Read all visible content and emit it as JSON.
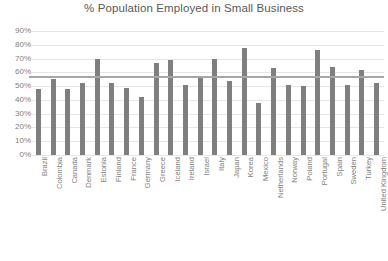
{
  "chart_data": {
    "type": "bar",
    "title": "% Population Employed in Small Business",
    "xlabel": "",
    "ylabel": "",
    "ylim": [
      0,
      90
    ],
    "ytick_labels": [
      "90%",
      "80%",
      "70%",
      "60%",
      "50%",
      "40%",
      "30%",
      "20%",
      "10%",
      "0%"
    ],
    "ytick_values": [
      90,
      80,
      70,
      60,
      50,
      40,
      30,
      20,
      10,
      0
    ],
    "grid": true,
    "legend": "none",
    "categories": [
      "Brazil",
      "Colombia",
      "Canada",
      "Denmark",
      "Estonia",
      "Finland",
      "France",
      "Germany",
      "Greece",
      "Iceland",
      "Ireland",
      "Israel",
      "Italy",
      "Japan",
      "Korea",
      "Mexico",
      "Netherlands",
      "Norway",
      "Poland",
      "Portugal",
      "Spain",
      "Sweden",
      "Turkey",
      "United Kingdom"
    ],
    "values": [
      48,
      55,
      48,
      52,
      70,
      52,
      49,
      42,
      67,
      69,
      51,
      57,
      70,
      54,
      78,
      38,
      63,
      51,
      50,
      76,
      64,
      51,
      62,
      52
    ],
    "series": [
      {
        "name": "% Population Employed in Small Business",
        "values": [
          48,
          55,
          48,
          52,
          70,
          52,
          49,
          42,
          67,
          69,
          51,
          57,
          70,
          54,
          78,
          38,
          63,
          51,
          50,
          76,
          64,
          51,
          62,
          52
        ],
        "color": "#7f7f7f"
      }
    ],
    "reference_line": {
      "name": "average",
      "value": 57,
      "color": "#a6a6a6"
    },
    "colors": {
      "bar": "#7f7f7f",
      "gridline": "#e6e6e6",
      "text": "#7f7f7f",
      "title": "#595959",
      "background": "#ffffff"
    }
  }
}
